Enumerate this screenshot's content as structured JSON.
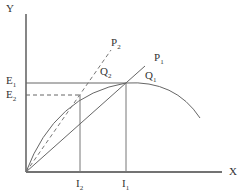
{
  "diagram": {
    "axes": {
      "y_label": "Y",
      "x_label": "X"
    },
    "lines": [
      {
        "id": "P1",
        "label": "P",
        "sub": "1",
        "style": "solid"
      },
      {
        "id": "P2",
        "label": "P",
        "sub": "2",
        "style": "dashed"
      }
    ],
    "points": [
      {
        "id": "Q1",
        "label": "Q",
        "sub": "1"
      },
      {
        "id": "Q2",
        "label": "Q",
        "sub": "2"
      }
    ],
    "y_ticks": [
      {
        "id": "E1",
        "label": "E",
        "sub": "1"
      },
      {
        "id": "E2",
        "label": "E",
        "sub": "2"
      }
    ],
    "x_ticks": [
      {
        "id": "I2",
        "label": "I",
        "sub": "2"
      },
      {
        "id": "I1",
        "label": "I",
        "sub": "1"
      }
    ],
    "colors": {
      "line": "#555555",
      "axis": "#444444"
    }
  }
}
